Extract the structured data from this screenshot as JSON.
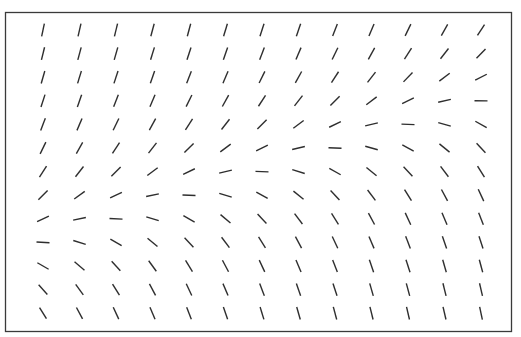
{
  "diagram": {
    "type": "slope-field",
    "frame": {
      "x": 5.5,
      "y": 12.5,
      "width": 506,
      "height": 319,
      "stroke": "#3a3a3a"
    },
    "segment": {
      "length": 13,
      "color": "#2e2e2e",
      "width": 1.4
    },
    "grid": {
      "columns_x": [
        43,
        79.5,
        116,
        152.5,
        189,
        225.5,
        262,
        298.5,
        335,
        371.5,
        408,
        444.5,
        481
      ],
      "rows_y": [
        30,
        53.6,
        77.2,
        100.8,
        124.4,
        148,
        171.6,
        195.2,
        218.8,
        242.4,
        266,
        289.6,
        313.2
      ]
    },
    "angles_deg_rows": [
      [
        78,
        77,
        76,
        75,
        75,
        73,
        72,
        71,
        69,
        67,
        64,
        61,
        57
      ],
      [
        76,
        75,
        74,
        73,
        72,
        71,
        69,
        67,
        64,
        61,
        57,
        52,
        46
      ],
      [
        74,
        73,
        72,
        71,
        69,
        67,
        64,
        61,
        57,
        52,
        46,
        37,
        27
      ],
      [
        72,
        71,
        69,
        67,
        64,
        61,
        57,
        52,
        45,
        37,
        26,
        13,
        -1
      ],
      [
        69,
        67,
        64,
        61,
        57,
        52,
        45,
        37,
        26,
        13,
        -2,
        -16,
        -29
      ],
      [
        64,
        61,
        57,
        52,
        45,
        37,
        26,
        13,
        -2,
        -16,
        -29,
        -39,
        -47
      ],
      [
        57,
        52,
        45,
        37,
        26,
        13,
        -2,
        -17,
        -29,
        -39,
        -47,
        -53,
        -58
      ],
      [
        45,
        36,
        25,
        12,
        -2,
        -17,
        -29,
        -39,
        -47,
        -53,
        -58,
        -62,
        -65
      ],
      [
        25,
        12,
        -3,
        -17,
        -30,
        -40,
        -47,
        -53,
        -58,
        -62,
        -65,
        -67,
        -69
      ],
      [
        -3,
        -17,
        -30,
        -40,
        -47,
        -53,
        -58,
        -62,
        -65,
        -67,
        -69,
        -71,
        -72
      ],
      [
        -30,
        -40,
        -48,
        -54,
        -58,
        -62,
        -65,
        -67,
        -69,
        -71,
        -72,
        -74,
        -75
      ],
      [
        -48,
        -54,
        -58,
        -62,
        -65,
        -67,
        -69,
        -71,
        -72,
        -74,
        -75,
        -76,
        -77
      ],
      [
        -58,
        -62,
        -65,
        -67,
        -69,
        -71,
        -73,
        -74,
        -75,
        -76,
        -77,
        -77,
        -78
      ]
    ]
  }
}
